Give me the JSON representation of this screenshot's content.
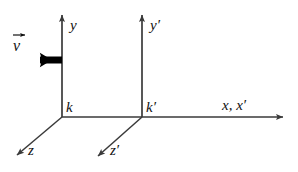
{
  "diagram": {
    "background_color": "#ffffff",
    "line_color": "#3a3a3a",
    "text_color": "#111111",
    "vector_color": "#000000",
    "frames": [
      {
        "name": "k",
        "label": "k",
        "origin": {
          "x": 62,
          "y": 117
        },
        "axes": [
          {
            "name": "y",
            "label": "y",
            "tip": {
              "x": 62,
              "y": 11
            }
          },
          {
            "name": "z",
            "label": "z",
            "tip": {
              "x": 12,
              "y": 159
            }
          },
          {
            "name": "x",
            "label": "x, x′",
            "tip": {
              "x": 289,
              "y": 117
            }
          }
        ]
      },
      {
        "name": "k-prime",
        "label": "k′",
        "origin": {
          "x": 142,
          "y": 117
        },
        "axes": [
          {
            "name": "y-prime",
            "label": "y′",
            "tip": {
              "x": 142,
              "y": 11
            }
          },
          {
            "name": "z-prime",
            "label": "z′",
            "tip": {
              "x": 93,
              "y": 160
            }
          }
        ]
      }
    ],
    "velocity_vector": {
      "symbol": "v",
      "label": "v⃗",
      "direction": "left",
      "tail": {
        "x": 62,
        "y": 60
      },
      "head": {
        "x": 27,
        "y": 60
      }
    },
    "labels": {
      "y": "y",
      "y_prime": "y′",
      "z": "z",
      "z_prime": "z′",
      "x_combined": "x, x′",
      "k": "k",
      "k_prime": "k′",
      "v": "v"
    }
  }
}
